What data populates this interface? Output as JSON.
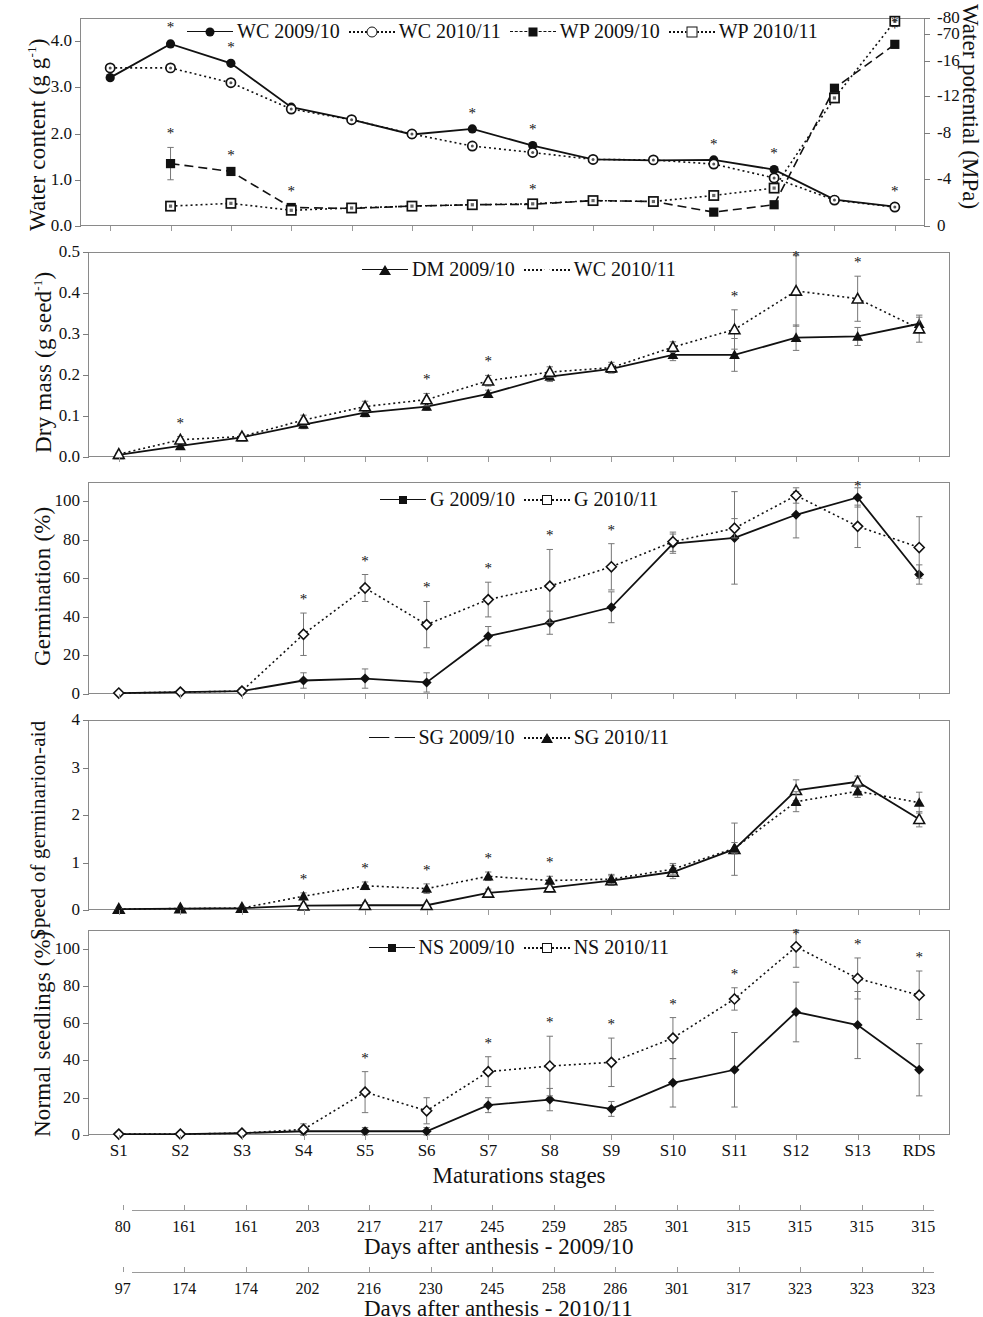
{
  "figure": {
    "x_categories": [
      "S1",
      "S2",
      "S3",
      "S4",
      "S5",
      "S6",
      "S7",
      "S8",
      "S9",
      "S10",
      "S11",
      "S12",
      "S13",
      "RDS"
    ],
    "x_axis_title": "Maturations stages",
    "strips": [
      {
        "title": "Days after anthesis - 2009/10",
        "values": [
          "80",
          "161",
          "161",
          "203",
          "217",
          "217",
          "245",
          "259",
          "285",
          "301",
          "315",
          "315",
          "315",
          "315"
        ]
      },
      {
        "title": "Days after anthesis - 2010/11",
        "values": [
          "97",
          "174",
          "174",
          "202",
          "216",
          "230",
          "245",
          "258",
          "286",
          "301",
          "317",
          "323",
          "323",
          "323"
        ]
      }
    ]
  },
  "chart_data": [
    {
      "type": "line",
      "panel": "A",
      "title": "",
      "xlabel": "Maturations stages",
      "ylabel": "Water content (g g-1)",
      "ylabel_main": "Water content (g g",
      "ylabel_sup": "-1",
      "ylabel_tail": ")",
      "y2label": "Water potential (MPa)",
      "categories": [
        "S1",
        "S2",
        "S3",
        "S4",
        "S5",
        "S6",
        "S7",
        "S8",
        "S9",
        "S10",
        "S11",
        "S12",
        "S13",
        "RDS"
      ],
      "ylim": [
        0.0,
        4.5
      ],
      "yticks": [
        "0.0",
        "1.0",
        "2.0",
        "3.0",
        "4.0"
      ],
      "ytick_values": [
        0.0,
        1.0,
        2.0,
        3.0,
        4.0
      ],
      "y2ticks": [
        "0",
        "-4",
        "-8",
        "-12",
        "-16",
        "-70",
        "-80"
      ],
      "y2tick_values": [
        0,
        -4,
        -8,
        -12,
        -16,
        -70,
        -80
      ],
      "grid": false,
      "legend_position": "top-center",
      "series": [
        {
          "name": "WC 2009/10",
          "axis": "left",
          "marker": "circle-filled",
          "line": "solid",
          "values": [
            3.21,
            3.94,
            3.52,
            2.57,
            2.3,
            1.98,
            2.1,
            1.74,
            1.44,
            1.42,
            1.43,
            1.22,
            0.57,
            0.42
          ],
          "errors": [
            0.05,
            0.06,
            0.05,
            0.04,
            0.04,
            0.04,
            0.05,
            0.05,
            0.04,
            0.04,
            0.04,
            0.05,
            0.04,
            0.04
          ],
          "stars": [
            false,
            true,
            true,
            false,
            false,
            false,
            true,
            true,
            false,
            false,
            true,
            true,
            false,
            true
          ]
        },
        {
          "name": "WC 2010/11",
          "axis": "left",
          "marker": "circle-open",
          "line": "dotted",
          "values": [
            3.42,
            3.42,
            3.1,
            2.53,
            2.3,
            1.99,
            1.73,
            1.59,
            1.44,
            1.43,
            1.34,
            1.04,
            0.56,
            0.41
          ],
          "errors": [
            0.05,
            0.05,
            0.05,
            0.04,
            0.04,
            0.04,
            0.05,
            0.05,
            0.04,
            0.04,
            0.05,
            0.06,
            0.04,
            0.04
          ],
          "stars": [
            false,
            false,
            false,
            false,
            false,
            false,
            false,
            false,
            false,
            false,
            false,
            false,
            false,
            false
          ]
        },
        {
          "name": "WP 2009/10",
          "axis": "right",
          "marker": "square-filled",
          "line": "dashed",
          "values_left_scale": [
            null,
            1.35,
            1.18,
            0.4,
            0.38,
            0.43,
            0.46,
            0.47,
            0.55,
            0.53,
            0.3,
            0.46,
            2.98,
            3.93
          ],
          "values": [
            null,
            -2.4,
            -1.7,
            -0.1,
            -0.1,
            -0.2,
            -0.2,
            -0.2,
            -0.4,
            -0.4,
            0.1,
            -0.2,
            -44,
            -69
          ],
          "errors": [
            0,
            0.35,
            0.05,
            0.05,
            0.03,
            0.03,
            0.03,
            0.03,
            0.03,
            0.05,
            0.04,
            0.04,
            0.08,
            0.05
          ],
          "stars": [
            false,
            true,
            true,
            true,
            false,
            false,
            false,
            true,
            false,
            false,
            true,
            true,
            false,
            true
          ]
        },
        {
          "name": "WP 2010/11",
          "axis": "right",
          "marker": "square-open",
          "line": "dotted",
          "values_left_scale": [
            null,
            0.43,
            0.49,
            0.34,
            0.39,
            0.43,
            0.46,
            0.48,
            0.55,
            0.53,
            0.66,
            0.82,
            2.77,
            4.43
          ],
          "values": [
            null,
            -0.3,
            -0.5,
            0.1,
            -0.1,
            -0.2,
            -0.2,
            -0.3,
            -0.4,
            -0.4,
            -0.9,
            -1.7,
            -40,
            -75
          ],
          "errors": [
            0,
            0.04,
            0.04,
            0.04,
            0.03,
            0.03,
            0.03,
            0.03,
            0.03,
            0.04,
            0.05,
            0.05,
            0.1,
            0.05
          ],
          "stars": [
            false,
            false,
            false,
            false,
            false,
            false,
            false,
            false,
            false,
            false,
            false,
            false,
            false,
            true
          ]
        }
      ]
    },
    {
      "type": "line",
      "panel": "B",
      "ylabel": "Dry mass (g seed-1)",
      "ylabel_main": "Dry mass (g seed",
      "ylabel_sup": "-1",
      "ylabel_tail": ")",
      "categories": [
        "S1",
        "S2",
        "S3",
        "S4",
        "S5",
        "S6",
        "S7",
        "S8",
        "S9",
        "S10",
        "S11",
        "S12",
        "S13",
        "RDS"
      ],
      "ylim": [
        0.0,
        0.5
      ],
      "yticks": [
        "0.0",
        "0.1",
        "0.2",
        "0.3",
        "0.4",
        "0.5"
      ],
      "ytick_values": [
        0.0,
        0.1,
        0.2,
        0.3,
        0.4,
        0.5
      ],
      "grid": false,
      "legend_position": "top-center",
      "series": [
        {
          "name": "DM 2009/10",
          "marker": "triangle-filled",
          "line": "solid",
          "values": [
            0.005,
            0.027,
            0.048,
            0.079,
            0.108,
            0.123,
            0.154,
            0.196,
            0.215,
            0.249,
            0.249,
            0.291,
            0.294,
            0.325
          ],
          "errors": [
            0.003,
            0.006,
            0.005,
            0.01,
            0.01,
            0.009,
            0.009,
            0.012,
            0.01,
            0.014,
            0.04,
            0.031,
            0.022,
            0.016
          ],
          "stars": [
            false,
            false,
            false,
            false,
            false,
            false,
            false,
            false,
            false,
            false,
            false,
            false,
            false,
            false
          ]
        },
        {
          "name": "WC 2010/11",
          "marker": "triangle-open",
          "line": "dotted",
          "values": [
            0.007,
            0.042,
            0.05,
            0.09,
            0.123,
            0.14,
            0.186,
            0.207,
            0.218,
            0.268,
            0.311,
            0.405,
            0.386,
            0.313
          ],
          "errors": [
            0.003,
            0.008,
            0.006,
            0.012,
            0.013,
            0.015,
            0.013,
            0.013,
            0.013,
            0.013,
            0.048,
            0.086,
            0.055,
            0.033
          ],
          "stars": [
            false,
            true,
            false,
            false,
            false,
            true,
            true,
            false,
            false,
            false,
            true,
            true,
            true,
            false
          ]
        }
      ]
    },
    {
      "type": "line",
      "panel": "C",
      "ylabel": "Germination (%)",
      "categories": [
        "S1",
        "S2",
        "S3",
        "S4",
        "S5",
        "S6",
        "S7",
        "S8",
        "S9",
        "S10",
        "S11",
        "S12",
        "S13",
        "RDS"
      ],
      "ylim": [
        0,
        110
      ],
      "yticks": [
        "0",
        "20",
        "40",
        "60",
        "80",
        "100"
      ],
      "ytick_values": [
        0,
        20,
        40,
        60,
        80,
        100
      ],
      "grid": false,
      "legend_position": "top-center",
      "series": [
        {
          "name": "G 2009/10",
          "marker": "diamond-filled",
          "line": "solid",
          "values": [
            0.5,
            1,
            1.5,
            7,
            8,
            6,
            30,
            37,
            45,
            78,
            81,
            93,
            102,
            62
          ],
          "errors": [
            0.5,
            0.8,
            1.5,
            4,
            5,
            5,
            5,
            6,
            8,
            5,
            24,
            12,
            5,
            5
          ],
          "stars": [
            false,
            false,
            false,
            false,
            false,
            false,
            false,
            false,
            false,
            false,
            false,
            false,
            true,
            false
          ]
        },
        {
          "name": "G 2010/11",
          "marker": "diamond-open",
          "line": "dotted",
          "values": [
            0.5,
            1,
            1.5,
            31,
            55,
            36,
            49,
            56,
            66,
            79,
            86,
            103,
            87,
            76
          ],
          "errors": [
            0.5,
            0.8,
            1.5,
            11,
            7,
            12,
            9,
            19,
            12,
            5,
            5,
            4,
            11,
            16
          ],
          "stars": [
            false,
            false,
            false,
            true,
            true,
            true,
            true,
            true,
            true,
            false,
            false,
            false,
            false,
            false
          ]
        }
      ]
    },
    {
      "type": "line",
      "panel": "D",
      "ylabel": "Speed of germinarion-aid",
      "categories": [
        "S1",
        "S2",
        "S3",
        "S4",
        "S5",
        "S6",
        "S7",
        "S8",
        "S9",
        "S10",
        "S11",
        "S12",
        "S13",
        "RDS"
      ],
      "ylim": [
        0,
        4
      ],
      "yticks": [
        "0",
        "1",
        "2",
        "3",
        "4"
      ],
      "ytick_values": [
        0,
        1,
        2,
        3,
        4
      ],
      "grid": false,
      "legend_position": "top-center",
      "series": [
        {
          "name": "SG 2009/10",
          "marker": "triangle-open",
          "line": "solid",
          "values": [
            0.02,
            0.03,
            0.04,
            0.09,
            0.1,
            0.1,
            0.36,
            0.47,
            0.62,
            0.8,
            1.28,
            2.52,
            2.7,
            1.91
          ],
          "errors": [
            0.01,
            0.01,
            0.02,
            0.05,
            0.05,
            0.04,
            0.08,
            0.09,
            0.1,
            0.14,
            0.55,
            0.22,
            0.12,
            0.16
          ],
          "stars": [
            false,
            false,
            false,
            false,
            false,
            false,
            false,
            false,
            false,
            false,
            false,
            false,
            false,
            false
          ]
        },
        {
          "name": "SG 2010/11",
          "marker": "triangle-filled",
          "line": "dotted",
          "values": [
            0.02,
            0.03,
            0.04,
            0.29,
            0.51,
            0.45,
            0.71,
            0.62,
            0.65,
            0.86,
            1.3,
            2.28,
            2.5,
            2.26
          ],
          "errors": [
            0.01,
            0.01,
            0.02,
            0.07,
            0.08,
            0.1,
            0.09,
            0.09,
            0.1,
            0.12,
            0.12,
            0.21,
            0.13,
            0.22
          ],
          "stars": [
            false,
            false,
            false,
            true,
            true,
            true,
            true,
            true,
            false,
            false,
            false,
            false,
            false,
            false
          ]
        }
      ]
    },
    {
      "type": "line",
      "panel": "E",
      "ylabel": "Normal seedlings (%)",
      "categories": [
        "S1",
        "S2",
        "S3",
        "S4",
        "S5",
        "S6",
        "S7",
        "S8",
        "S9",
        "S10",
        "S11",
        "S12",
        "S13",
        "RDS"
      ],
      "ylim": [
        0,
        110
      ],
      "yticks": [
        "0",
        "20",
        "40",
        "60",
        "80",
        "100"
      ],
      "ytick_values": [
        0,
        20,
        40,
        60,
        80,
        100
      ],
      "grid": false,
      "legend_position": "top-center",
      "series": [
        {
          "name": "NS 2009/10",
          "marker": "diamond-filled",
          "line": "solid",
          "values": [
            0.5,
            0.5,
            1,
            2,
            2,
            2,
            16,
            19,
            14,
            28,
            35,
            66,
            59,
            35
          ],
          "errors": [
            0.5,
            0.5,
            1,
            2,
            2,
            2,
            4,
            6,
            4,
            13,
            20,
            16,
            18,
            14
          ],
          "stars": [
            false,
            false,
            false,
            false,
            false,
            false,
            false,
            false,
            false,
            false,
            false,
            false,
            false,
            false
          ]
        },
        {
          "name": "NS 2010/11",
          "marker": "diamond-open",
          "line": "dotted",
          "values": [
            0.5,
            0.5,
            1,
            3,
            23,
            13,
            34,
            37,
            39,
            52,
            73,
            101,
            84,
            75
          ],
          "errors": [
            0.5,
            0.5,
            1,
            3,
            11,
            7,
            8,
            16,
            13,
            11,
            6,
            11,
            11,
            13
          ],
          "stars": [
            false,
            false,
            false,
            false,
            true,
            false,
            true,
            true,
            true,
            true,
            true,
            true,
            true,
            true
          ]
        }
      ]
    }
  ]
}
